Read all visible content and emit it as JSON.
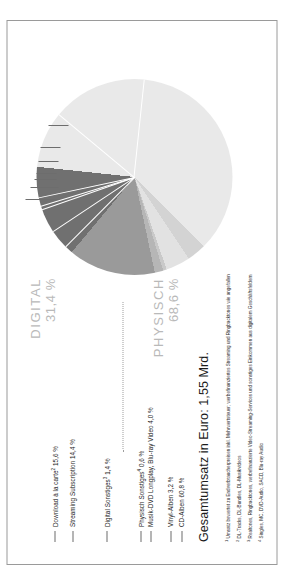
{
  "headline": "Gesamtumsatz in Euro: 1,55 Mrd.",
  "groups": {
    "digital": {
      "name": "DIGITAL",
      "value": "31,4 %"
    },
    "physical": {
      "name": "PHYSISCH",
      "value": "68,6 %"
    }
  },
  "labels": {
    "download": "Download à la carte",
    "download_sup": "2",
    "download_val": "15,6 %",
    "streaming": "Streaming Subscription",
    "streaming_val": "14,4 %",
    "digital_other": "Digital Sonstiges",
    "digital_other_sup": "3",
    "digital_other_val": "1,4 %",
    "phys_other": "Physisch Sonstiges",
    "phys_other_sup": "4",
    "phys_other_val": "0,6 %",
    "dvd": "Musik-DVD Longplay, Blu-ray Video",
    "dvd_val": "4,0 %",
    "vinyl": "Vinyl-Alben",
    "vinyl_val": "3,2 %",
    "cd": "CD-Alben",
    "cd_val": "60,8 %"
  },
  "footnotes": [
    {
      "marker": "1",
      "text": "Umsatz bewertet zu Endverbraucherpreisen inkl. Mehrwertsteuer; werbefinanziertes Streaming und Ringbacktones wie angefallen"
    },
    {
      "marker": "2",
      "text": "DL-Tracks, DL-Bundles, DL-Musikvideos"
    },
    {
      "marker": "3",
      "text": "Realtones, Ringbacktones, werbefinanzierte Video-Streaming-Services und sonstiges Einkommen aus digitalem Geschäftsfeldern"
    },
    {
      "marker": "4",
      "text": "Singles, MC, DVD-Audio, SACD, Blu-ray Audio"
    }
  ],
  "colors": {
    "cd": "#e9e9e9",
    "vinyl": "#d3d3d3",
    "dvd": "#e2e2e2",
    "phys_other": "#c9c9c9",
    "digital_other": "#b6b6b6",
    "streaming": "#9a9a9a",
    "download": "#707070",
    "group_text": "#b9b9b9",
    "frame": "#9a9a9a"
  },
  "chart_data": {
    "type": "pie",
    "title": "Gesamtumsatz in Euro: 1,55 Mrd.",
    "xlabel": "",
    "ylabel": "",
    "legend_position": "callout-labels",
    "grid": false,
    "categories": [
      "CD-Alben",
      "Vinyl-Alben",
      "Musik-DVD Longplay, Blu-ray Video",
      "Physisch Sonstiges",
      "Digital Sonstiges",
      "Streaming Subscription",
      "Download à la carte"
    ],
    "values": [
      60.8,
      3.2,
      4.0,
      0.6,
      1.4,
      14.4,
      15.6
    ],
    "unit": "%",
    "groups": [
      {
        "name": "PHYSISCH",
        "value": 68.6,
        "members": [
          "CD-Alben",
          "Vinyl-Alben",
          "Musik-DVD Longplay, Blu-ray Video",
          "Physisch Sonstiges"
        ]
      },
      {
        "name": "DIGITAL",
        "value": 31.4,
        "members": [
          "Digital Sonstiges",
          "Streaming Subscription",
          "Download à la carte"
        ]
      }
    ],
    "total_label": "Gesamtumsatz in Euro: 1,55 Mrd.",
    "total_value": 1.55,
    "total_unit": "Mrd. Euro"
  }
}
